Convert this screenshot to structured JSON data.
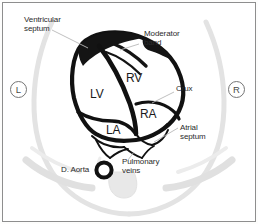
{
  "figure": {
    "background_color": "#ffffff",
    "border_color": "#8e8e8e",
    "heart_outline_color": "#111111",
    "thorax_color": "#dcdcdc",
    "leader_line_color": "#b4b4b4",
    "text_color": "#2b2b2b"
  },
  "annotations": {
    "ventricular_septum": "Ventricular\nseptum",
    "moderator_band": "Moderator\nband",
    "crux": "Crux",
    "atrial_septum": "Atrial\nseptum",
    "descending_aorta": "D. Aorta",
    "pulmonary_veins": "Pulmonary\nveins"
  },
  "chambers": {
    "left_ventricle": "LV",
    "right_ventricle": "RV",
    "left_atrium": "LA",
    "right_atrium": "RA"
  },
  "orientation": {
    "left_marker": "L",
    "right_marker": "R"
  }
}
